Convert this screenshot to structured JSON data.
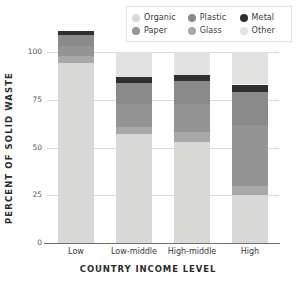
{
  "chart_data": {
    "type": "bar",
    "title": "",
    "subtitle": "",
    "xlabel": "COUNTRY INCOME LEVEL",
    "ylabel": "PERCENT OF SOLID WASTE",
    "ylim": [
      0,
      100
    ],
    "yticks": [
      0,
      25,
      50,
      75,
      100
    ],
    "ytick_labels": [
      "0",
      "25",
      "50",
      "75",
      "100"
    ],
    "grid": true,
    "stacked": true,
    "legend_position": "top-right",
    "categories": [
      "Low",
      "Low-middle",
      "High-middle",
      "High"
    ],
    "stack_order_bottom_to_top": [
      "Organic",
      "Glass",
      "Paper",
      "Plastic",
      "Metal",
      "Other"
    ],
    "series": [
      {
        "name": "Organic",
        "color": "#d8d8d6",
        "values": [
          94,
          57,
          53,
          25
        ]
      },
      {
        "name": "Glass",
        "color": "#a8a8a8",
        "values": [
          4,
          4,
          5,
          5
        ]
      },
      {
        "name": "Paper",
        "color": "#949494",
        "values": [
          5,
          12,
          15,
          32
        ]
      },
      {
        "name": "Plastic",
        "color": "#8a8a8a",
        "values": [
          6,
          11,
          12,
          17
        ]
      },
      {
        "name": "Metal",
        "color": "#2f2f2f",
        "values": [
          2,
          3,
          3,
          4
        ]
      },
      {
        "name": "Other",
        "color": "#e2e2e0",
        "values": [
          0,
          13,
          12,
          17
        ]
      }
    ]
  },
  "legend": {
    "rows": [
      [
        {
          "label": "Organic",
          "color": "#d8d8d6",
          "swatch": "dot-swatch"
        },
        {
          "label": "Plastic",
          "color": "#8a8a8a",
          "swatch": "dot-swatch"
        },
        {
          "label": "Metal",
          "color": "#2f2f2f",
          "swatch": "dot-swatch"
        }
      ],
      [
        {
          "label": "Paper",
          "color": "#949494",
          "swatch": "dot-swatch"
        },
        {
          "label": "Glass",
          "color": "#a8a8a8",
          "swatch": "dot-swatch"
        },
        {
          "label": "Other",
          "color": "#e2e2e0",
          "swatch": "dot-swatch"
        }
      ]
    ]
  },
  "axes": {
    "y_label": "PERCENT OF SOLID WASTE",
    "x_label": "COUNTRY INCOME LEVEL",
    "y_ticks": [
      "100",
      "75",
      "50",
      "25",
      "0"
    ],
    "x_ticks": [
      "Low",
      "Low-middle",
      "High-middle",
      "High"
    ]
  },
  "colors": {
    "grid": "#d8d8d8",
    "axis": "#6f6f6f",
    "text": "#2b2b2b",
    "background": "#ffffff"
  }
}
